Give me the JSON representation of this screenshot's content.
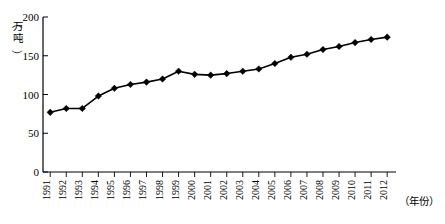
{
  "chart_data": {
    "type": "line",
    "title": "",
    "xlabel": "（年份）",
    "ylabel": "（万吨）",
    "ylim": [
      0,
      200
    ],
    "yticks": [
      0,
      50,
      100,
      150,
      200
    ],
    "ytick_labels": [
      "0",
      "50",
      "100",
      "150",
      "200"
    ],
    "grid": false,
    "legend": "none",
    "marker": "diamond",
    "line_color": "#000000",
    "marker_color": "#000000",
    "categories": [
      "1991",
      "1992",
      "1993",
      "1994",
      "1995",
      "1996",
      "1997",
      "1998",
      "1999",
      "2000",
      "2001",
      "2002",
      "2003",
      "2004",
      "2005",
      "2006",
      "2007",
      "2008",
      "2009",
      "2010",
      "2011",
      "2012"
    ],
    "values": [
      77,
      82,
      82,
      98,
      108,
      113,
      116,
      120,
      130,
      126,
      125,
      127,
      130,
      133,
      140,
      148,
      152,
      158,
      162,
      167,
      171,
      174
    ],
    "series": [
      {
        "name": "产量",
        "values": [
          77,
          82,
          82,
          98,
          108,
          113,
          116,
          120,
          130,
          126,
          125,
          127,
          130,
          133,
          140,
          148,
          152,
          158,
          162,
          167,
          171,
          174
        ]
      }
    ]
  },
  "axes": {
    "y_unit_char_1": "万",
    "y_unit_char_2": "吨",
    "y_unit_paren_open": "（",
    "y_unit_paren_close": "）",
    "x_axis_caption": "（年份）"
  }
}
